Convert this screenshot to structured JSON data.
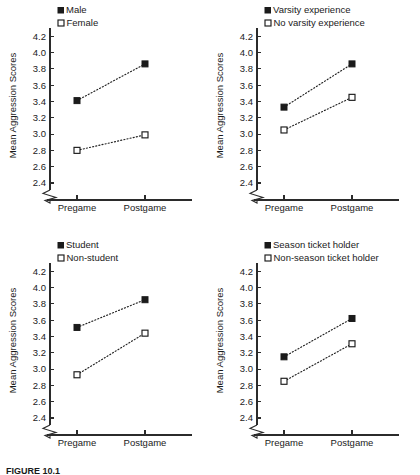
{
  "figure": {
    "caption": "FIGURE 10.1  ",
    "ylabel": "Mean Aggression Scores",
    "categories": [
      "Pregame",
      "Postgame"
    ],
    "yticks": [
      "2.4",
      "2.6",
      "2.8",
      "3.0",
      "3.2",
      "3.4",
      "3.6",
      "3.8",
      "4.0",
      "4.2"
    ],
    "ylim": [
      2.4,
      4.3
    ],
    "axis_break": "y-axis-break-zigzag"
  },
  "chart_data": [
    {
      "type": "line",
      "panel": "top-left",
      "title": "",
      "xlabel": "",
      "ylabel": "Mean Aggression Scores",
      "categories": [
        "Pregame",
        "Postgame"
      ],
      "ylim": [
        2.4,
        4.3
      ],
      "yticks": [
        2.4,
        2.6,
        2.8,
        3.0,
        3.2,
        3.4,
        3.6,
        3.8,
        4.0,
        4.2
      ],
      "grid": false,
      "legend_position": "top-left",
      "series": [
        {
          "name": "Male",
          "marker": "filled-square",
          "values": [
            3.41,
            3.86
          ]
        },
        {
          "name": "Female",
          "marker": "open-square",
          "values": [
            2.8,
            2.99
          ]
        }
      ]
    },
    {
      "type": "line",
      "panel": "top-right",
      "title": "",
      "xlabel": "",
      "ylabel": "Mean Aggression Scores",
      "categories": [
        "Pregame",
        "Postgame"
      ],
      "ylim": [
        2.4,
        4.3
      ],
      "yticks": [
        2.4,
        2.6,
        2.8,
        3.0,
        3.2,
        3.4,
        3.6,
        3.8,
        4.0,
        4.2
      ],
      "grid": false,
      "legend_position": "top-left",
      "series": [
        {
          "name": "Varsity experience",
          "marker": "filled-square",
          "values": [
            3.33,
            3.86
          ]
        },
        {
          "name": "No varsity experience",
          "marker": "open-square",
          "values": [
            3.05,
            3.45
          ]
        }
      ]
    },
    {
      "type": "line",
      "panel": "bottom-left",
      "title": "",
      "xlabel": "",
      "ylabel": "Mean Aggression Scores",
      "categories": [
        "Pregame",
        "Postgame"
      ],
      "ylim": [
        2.4,
        4.3
      ],
      "yticks": [
        2.4,
        2.6,
        2.8,
        3.0,
        3.2,
        3.4,
        3.6,
        3.8,
        4.0,
        4.2
      ],
      "grid": false,
      "legend_position": "top-left",
      "series": [
        {
          "name": "Student",
          "marker": "filled-square",
          "values": [
            3.51,
            3.85
          ]
        },
        {
          "name": "Non-student",
          "marker": "open-square",
          "values": [
            2.93,
            3.44
          ]
        }
      ]
    },
    {
      "type": "line",
      "panel": "bottom-right",
      "title": "",
      "xlabel": "",
      "ylabel": "Mean Aggression Scores",
      "categories": [
        "Pregame",
        "Postgame"
      ],
      "ylim": [
        2.4,
        4.3
      ],
      "yticks": [
        2.4,
        2.6,
        2.8,
        3.0,
        3.2,
        3.4,
        3.6,
        3.8,
        4.0,
        4.2
      ],
      "grid": false,
      "legend_position": "top-left",
      "series": [
        {
          "name": "Season ticket holder",
          "marker": "filled-square",
          "values": [
            3.15,
            3.62
          ]
        },
        {
          "name": "Non-season ticket holder",
          "marker": "open-square",
          "values": [
            2.85,
            3.31
          ]
        }
      ]
    }
  ]
}
